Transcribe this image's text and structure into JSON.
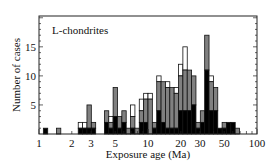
{
  "chart_data": {
    "type": "bar",
    "subtype": "stacked-histogram",
    "title": "L-chondrites",
    "xlabel": "Exposure age (Ma)",
    "ylabel": "Number of cases",
    "xscale": "log",
    "xlim": [
      1,
      100
    ],
    "ylim": [
      0,
      20
    ],
    "xticks": [
      "1",
      "2",
      "3",
      "5",
      "10",
      "20",
      "30",
      "50",
      "100"
    ],
    "yticks": [
      "5",
      "10",
      "15"
    ],
    "grid": false,
    "legend": null,
    "bin_width_log10": 0.04,
    "series_colors": {
      "black": "#000000",
      "gray": "#808080",
      "white": "#ffffff"
    },
    "bins": [
      {
        "left_log10": 0.04,
        "black": 1,
        "gray": 0,
        "white": 0
      },
      {
        "left_log10": 0.16,
        "black": 0,
        "gray": 1,
        "white": 0
      },
      {
        "left_log10": 0.36,
        "black": 1,
        "gray": 0,
        "white": 1
      },
      {
        "left_log10": 0.4,
        "black": 1,
        "gray": 0,
        "white": 1
      },
      {
        "left_log10": 0.44,
        "black": 1,
        "gray": 4,
        "white": 0
      },
      {
        "left_log10": 0.48,
        "black": 1,
        "gray": 1,
        "white": 0
      },
      {
        "left_log10": 0.52,
        "black": 0,
        "gray": 0,
        "white": 0
      },
      {
        "left_log10": 0.6,
        "black": 2,
        "gray": 2,
        "white": 0
      },
      {
        "left_log10": 0.64,
        "black": 1,
        "gray": 1,
        "white": 1
      },
      {
        "left_log10": 0.68,
        "black": 3,
        "gray": 5,
        "white": 0
      },
      {
        "left_log10": 0.72,
        "black": 1,
        "gray": 2,
        "white": 0
      },
      {
        "left_log10": 0.76,
        "black": 2,
        "gray": 2,
        "white": 0
      },
      {
        "left_log10": 0.8,
        "black": 0,
        "gray": 1,
        "white": 0
      },
      {
        "left_log10": 0.84,
        "black": 1,
        "gray": 2,
        "white": 2
      },
      {
        "left_log10": 0.88,
        "black": 0,
        "gray": 1,
        "white": 0
      },
      {
        "left_log10": 0.92,
        "black": 2,
        "gray": 2,
        "white": 2
      },
      {
        "left_log10": 0.96,
        "black": 2,
        "gray": 4,
        "white": 1
      },
      {
        "left_log10": 1.0,
        "black": 0,
        "gray": 6,
        "white": 1
      },
      {
        "left_log10": 1.04,
        "black": 1,
        "gray": 1,
        "white": 0
      },
      {
        "left_log10": 1.08,
        "black": 4,
        "gray": 5,
        "white": 1
      },
      {
        "left_log10": 1.12,
        "black": 2,
        "gray": 7,
        "white": 0
      },
      {
        "left_log10": 1.16,
        "black": 1,
        "gray": 7,
        "white": 1
      },
      {
        "left_log10": 1.2,
        "black": 1,
        "gray": 7,
        "white": 0
      },
      {
        "left_log10": 1.24,
        "black": 1,
        "gray": 6,
        "white": 1
      },
      {
        "left_log10": 1.28,
        "black": 4,
        "gray": 6,
        "white": 2
      },
      {
        "left_log10": 1.32,
        "black": 4,
        "gray": 7,
        "white": 4
      },
      {
        "left_log10": 1.36,
        "black": 4,
        "gray": 7,
        "white": 0
      },
      {
        "left_log10": 1.4,
        "black": 5,
        "gray": 5,
        "white": 0
      },
      {
        "left_log10": 1.44,
        "black": 1,
        "gray": 1,
        "white": 0
      },
      {
        "left_log10": 1.48,
        "black": 2,
        "gray": 2,
        "white": 0
      },
      {
        "left_log10": 1.52,
        "black": 11,
        "gray": 6,
        "white": 0
      },
      {
        "left_log10": 1.56,
        "black": 4,
        "gray": 5,
        "white": 1
      },
      {
        "left_log10": 1.6,
        "black": 4,
        "gray": 4,
        "white": 0
      },
      {
        "left_log10": 1.64,
        "black": 1,
        "gray": 0,
        "white": 0
      },
      {
        "left_log10": 1.68,
        "black": 1,
        "gray": 1,
        "white": 0
      },
      {
        "left_log10": 1.72,
        "black": 2,
        "gray": 0,
        "white": 0
      },
      {
        "left_log10": 1.76,
        "black": 2,
        "gray": 0,
        "white": 0
      },
      {
        "left_log10": 1.8,
        "black": 0,
        "gray": 1,
        "white": 0
      }
    ]
  }
}
